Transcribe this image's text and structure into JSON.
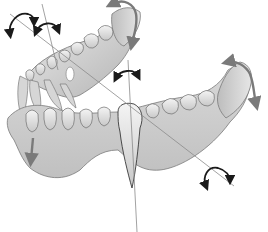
{
  "figure": {
    "caption": "",
    "palette": {
      "background": "#ffffff",
      "gum_light": "#e4e4e4",
      "gum_mid": "#c8c8c8",
      "gum_dark": "#9a9a9a",
      "tooth_light": "#f0f0f0",
      "outline": "#6e6e6e",
      "axis_line": "#8a8a8a",
      "arrow_black": "#1a1a1a",
      "arrow_gray": "#7a7a7a"
    },
    "annotations": [
      {
        "name": "upper-left-rotation-arrow",
        "style": "black-curved-double"
      },
      {
        "name": "upper-incisor-rotation-arrow",
        "style": "black-curved-double"
      },
      {
        "name": "upper-molar-rotation-arrow",
        "style": "gray-curved-double"
      },
      {
        "name": "center-tooth-rotation-arrow",
        "style": "black-curved-double"
      },
      {
        "name": "right-ramus-rotation-arrow",
        "style": "gray-curved-double"
      },
      {
        "name": "left-translation-arrow",
        "style": "gray-straight-down"
      },
      {
        "name": "lower-right-rotation-arrow",
        "style": "black-curved-double"
      }
    ]
  }
}
